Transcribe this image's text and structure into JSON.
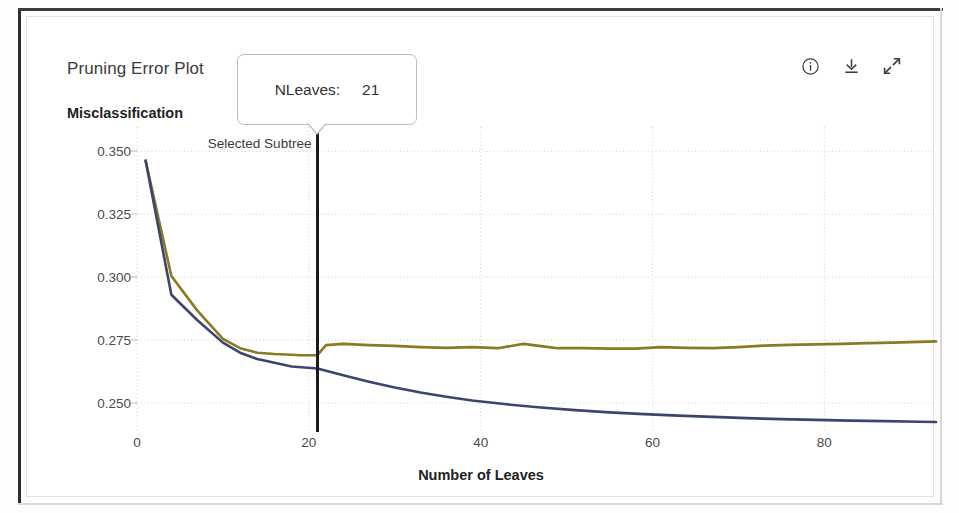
{
  "window": {
    "panel_title": "Pruning Error Plot"
  },
  "toolbar": {
    "items": [
      {
        "name": "info-icon",
        "label": "Info"
      },
      {
        "name": "download-icon",
        "label": "Download"
      },
      {
        "name": "expand-icon",
        "label": "Expand"
      }
    ]
  },
  "tooltip": {
    "key": "NLeaves:",
    "value": "21"
  },
  "annotation": {
    "selected_subtree_label": "Selected Subtree",
    "selected_subtree_x": 21
  },
  "colors": {
    "resubstitution_curve": "#3b456f",
    "crossvalidation_curve": "#8a7a24",
    "marker_line": "#1b1b1b",
    "grid": "#cfcfcf",
    "axis_text": "#4a4a4a",
    "title_text": "#3b3b3b"
  },
  "chart_data": {
    "type": "line",
    "title": "Pruning Error Plot",
    "xlabel": "Number of Leaves",
    "ylabel": "Misclassification",
    "xlim": [
      0,
      93
    ],
    "ylim": [
      0.2385,
      0.3525
    ],
    "xticks": [
      0,
      20,
      40,
      60,
      80
    ],
    "xtick_labels": [
      "0",
      "20",
      "40",
      "60",
      "80"
    ],
    "yticks": [
      0.25,
      0.275,
      0.3,
      0.325,
      0.35
    ],
    "ytick_labels": [
      "0.250",
      "0.275",
      "0.300",
      "0.325",
      "0.350"
    ],
    "grid": true,
    "legend": null,
    "annotations": [
      {
        "text": "Selected Subtree",
        "x": 21,
        "type": "vertical-line"
      },
      {
        "text": "NLeaves:  21",
        "type": "tooltip"
      }
    ],
    "series": [
      {
        "name": "Cross-validation error",
        "color": "#8a7a24",
        "x": [
          1,
          4,
          7,
          10,
          12,
          14,
          16,
          18,
          19,
          21,
          22,
          24,
          27,
          30,
          33,
          36,
          39,
          42,
          45,
          47,
          49,
          52,
          55,
          58,
          61,
          64,
          67,
          70,
          73,
          76,
          79,
          82,
          85,
          88,
          91,
          93
        ],
        "y": [
          0.3463,
          0.3005,
          0.2868,
          0.2755,
          0.2718,
          0.27,
          0.2695,
          0.2692,
          0.269,
          0.269,
          0.273,
          0.2735,
          0.273,
          0.2727,
          0.2722,
          0.2719,
          0.2722,
          0.2718,
          0.2735,
          0.2726,
          0.2718,
          0.2718,
          0.2716,
          0.2716,
          0.2722,
          0.2719,
          0.2718,
          0.2722,
          0.2728,
          0.2731,
          0.2733,
          0.2735,
          0.2738,
          0.274,
          0.2743,
          0.2745
        ]
      },
      {
        "name": "Resubstitution error",
        "color": "#3b456f",
        "x": [
          1,
          4,
          7,
          10,
          12,
          14,
          16,
          18,
          21,
          24,
          27,
          30,
          33,
          36,
          39,
          43,
          47,
          51,
          55,
          59,
          63,
          67,
          71,
          75,
          79,
          83,
          87,
          91,
          93
        ],
        "y": [
          0.3463,
          0.293,
          0.283,
          0.274,
          0.27,
          0.2675,
          0.266,
          0.2645,
          0.2637,
          0.261,
          0.2585,
          0.2562,
          0.2542,
          0.2525,
          0.251,
          0.2495,
          0.2482,
          0.2472,
          0.2463,
          0.2456,
          0.245,
          0.2445,
          0.244,
          0.2436,
          0.2433,
          0.243,
          0.2428,
          0.2426,
          0.2425
        ]
      }
    ]
  }
}
